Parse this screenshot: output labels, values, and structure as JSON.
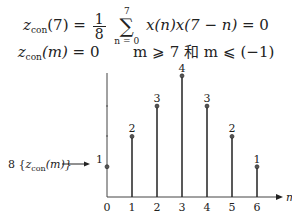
{
  "equations": {
    "eq1": {
      "lhs_var": "z",
      "lhs_sub": "con",
      "lhs_arg": "(7)",
      "equals": "=",
      "frac_num": "1",
      "frac_den": "8",
      "sum_top": "7",
      "sum_bottom": "n = 0",
      "sum_symbol": "∑",
      "body": "x(n)x(7 − n)",
      "rhs": "= 0"
    },
    "eq2": {
      "lhs_var": "z",
      "lhs_sub": "con",
      "lhs_arg": "(m)",
      "rhs": "= 0",
      "condition": "m ⩾ 7 和 m ⩽ (−1)"
    }
  },
  "arrow_label": {
    "prefix": "8 {",
    "var": "z",
    "sub": "con",
    "arg": "(m)}"
  },
  "chart_data": {
    "type": "stem",
    "title": "",
    "xlabel": "m",
    "ylabel": "8 {z_con(m)}",
    "x": [
      0,
      1,
      2,
      3,
      4,
      5,
      6
    ],
    "values": [
      1,
      2,
      3,
      4,
      3,
      2,
      1
    ],
    "data_labels": [
      "1",
      "2",
      "3",
      "4",
      "3",
      "2",
      "1"
    ],
    "xticks": [
      "0",
      "1",
      "2",
      "3",
      "4",
      "5",
      "6"
    ],
    "ylim": [
      0,
      4
    ],
    "grid": false,
    "legend": null
  },
  "colors": {
    "ink": "#222222",
    "background": "#ffffff"
  }
}
